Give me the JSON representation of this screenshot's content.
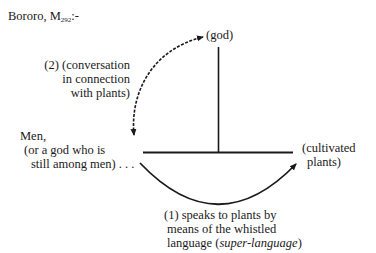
{
  "title": {
    "prefix": "Bororo, M",
    "subscript": "292",
    "suffix": ":-"
  },
  "nodes": {
    "god": "(god)",
    "men": {
      "line1": "Men,",
      "line2": "(or a god who is",
      "line3": "still among men) . . ."
    },
    "plants": {
      "line1": "(cultivated",
      "line2": "plants)"
    }
  },
  "edges": {
    "conversation": {
      "line1": "(2) (conversation",
      "line2": "in connection",
      "line3": "with plants)",
      "style": "dashed",
      "arrows": "both"
    },
    "speaks": {
      "line1": "(1) speaks to plants by",
      "line2": "means of the whistled",
      "line3_plain": "language (",
      "line3_italic": "super-language",
      "line3_end": ")",
      "style": "solid",
      "arrows": "end"
    }
  },
  "colors": {
    "ink": "#1a1a1a",
    "background": "#ffffff"
  }
}
